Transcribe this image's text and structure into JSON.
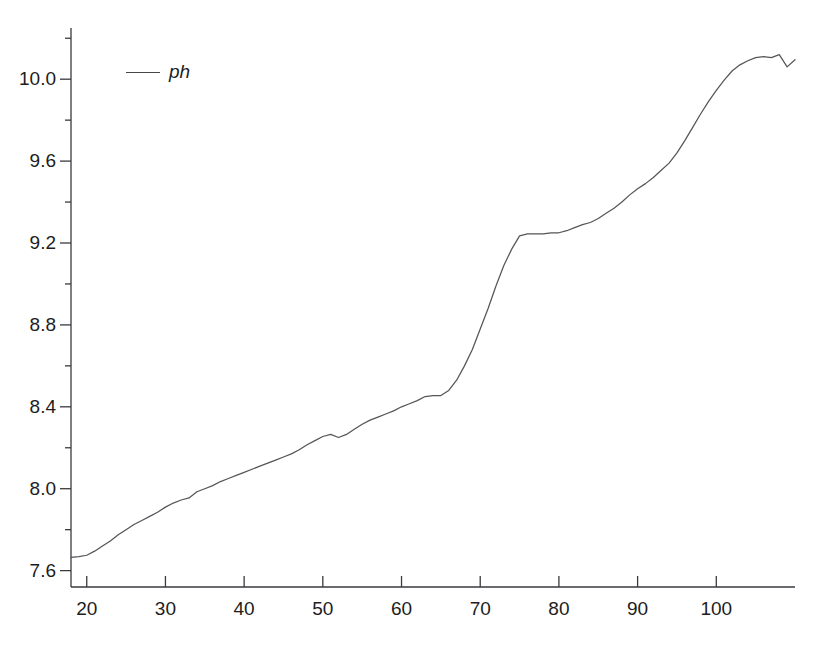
{
  "figure": {
    "background_color": "#ffffff",
    "line_color": "#55555a",
    "axis_color": "#3a3a3f",
    "text_color": "#1d1d1d"
  },
  "legend": {
    "position": "top-left-inside",
    "entries": [
      {
        "label": "ph",
        "style": "line",
        "color": "#45454a"
      }
    ]
  },
  "caption": {
    "text": ""
  },
  "chart_data": {
    "type": "line",
    "title": "",
    "subtitle": "",
    "xlabel": "",
    "ylabel": "",
    "xlim": [
      18,
      110
    ],
    "ylim": [
      7.52,
      10.25
    ],
    "grid": false,
    "legend_position": "top-left-inside",
    "x_ticks": [
      20,
      30,
      40,
      50,
      60,
      70,
      80,
      90,
      100
    ],
    "x_tick_labels": [
      "20",
      "30",
      "40",
      "50",
      "60",
      "70",
      "80",
      "90",
      "100"
    ],
    "x_minor_ticks": [],
    "y_ticks": [
      7.6,
      8.0,
      8.4,
      8.8,
      9.2,
      9.6,
      10.0
    ],
    "y_tick_labels": [
      "7.6",
      "8.0",
      "8.4",
      "8.8",
      "9.2",
      "9.6",
      "10.0"
    ],
    "y_minor_ticks": [
      7.8,
      8.2,
      8.6,
      9.0,
      9.4,
      9.8,
      10.2
    ],
    "series": [
      {
        "name": "ph",
        "color": "#55555a",
        "x": [
          18,
          19,
          20,
          21,
          22,
          23,
          24,
          25,
          26,
          27,
          28,
          29,
          30,
          31,
          32,
          33,
          34,
          35,
          36,
          37,
          38,
          39,
          40,
          41,
          42,
          43,
          44,
          45,
          46,
          47,
          48,
          49,
          50,
          51,
          52,
          53,
          54,
          55,
          56,
          57,
          58,
          59,
          60,
          61,
          62,
          63,
          64,
          65,
          66,
          67,
          68,
          69,
          70,
          71,
          72,
          73,
          74,
          75,
          76,
          77,
          78,
          79,
          80,
          81,
          82,
          83,
          84,
          85,
          86,
          87,
          88,
          89,
          90,
          91,
          92,
          93,
          94,
          95,
          96,
          97,
          98,
          99,
          100,
          101,
          102,
          103,
          104,
          105,
          106,
          107,
          108,
          109,
          110
        ],
        "y": [
          7.665,
          7.668,
          7.675,
          7.695,
          7.72,
          7.745,
          7.775,
          7.8,
          7.825,
          7.845,
          7.865,
          7.885,
          7.91,
          7.93,
          7.945,
          7.955,
          7.985,
          8.0,
          8.015,
          8.035,
          8.05,
          8.065,
          8.08,
          8.095,
          8.11,
          8.125,
          8.14,
          8.155,
          8.17,
          8.19,
          8.215,
          8.235,
          8.255,
          8.265,
          8.25,
          8.265,
          8.29,
          8.315,
          8.335,
          8.35,
          8.365,
          8.38,
          8.4,
          8.415,
          8.43,
          8.45,
          8.455,
          8.455,
          8.48,
          8.53,
          8.6,
          8.68,
          8.78,
          8.88,
          8.99,
          9.09,
          9.17,
          9.235,
          9.245,
          9.245,
          9.245,
          9.25,
          9.25,
          9.26,
          9.275,
          9.29,
          9.3,
          9.32,
          9.345,
          9.37,
          9.4,
          9.435,
          9.465,
          9.49,
          9.52,
          9.555,
          9.59,
          9.64,
          9.7,
          9.765,
          9.83,
          9.89,
          9.945,
          9.995,
          10.04,
          10.07,
          10.09,
          10.105,
          10.11,
          10.105,
          10.12,
          10.06,
          10.095
        ]
      }
    ]
  }
}
